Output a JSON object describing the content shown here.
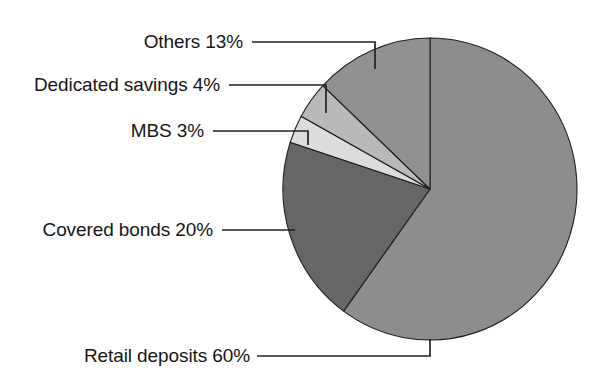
{
  "chart_data": {
    "type": "pie",
    "title": "",
    "subtitle": "",
    "xlabel": "",
    "ylabel": "",
    "legend_position": "none",
    "grid": false,
    "units": "percent",
    "start_angle_deg": 0,
    "direction": "clockwise",
    "categories": [
      "Retail deposits",
      "Covered bonds",
      "MBS",
      "Dedicated savings",
      "Others"
    ],
    "values": [
      60,
      20,
      3,
      4,
      13
    ],
    "slices": [
      {
        "name": "retail-deposits",
        "label": "Retail deposits 60%",
        "category": "Retail deposits",
        "value": 60,
        "value_text": "60%",
        "color": "#8d8d8d",
        "start_angle_deg": 0,
        "end_angle_deg": 216
      },
      {
        "name": "covered-bonds",
        "label": "Covered bonds 20%",
        "category": "Covered bonds",
        "value": 20,
        "value_text": "20%",
        "color": "#666666",
        "start_angle_deg": 216,
        "end_angle_deg": 288
      },
      {
        "name": "mbs",
        "label": "MBS 3%",
        "category": "MBS",
        "value": 3,
        "value_text": "3%",
        "color": "#dcdcdc",
        "start_angle_deg": 288,
        "end_angle_deg": 298.8
      },
      {
        "name": "dedicated-savings",
        "label": "Dedicated savings 4%",
        "category": "Dedicated savings",
        "value": 4,
        "value_text": "4%",
        "color": "#b9b9b9",
        "start_angle_deg": 298.8,
        "end_angle_deg": 313.2
      },
      {
        "name": "others",
        "label": "Others 13%",
        "category": "Others",
        "value": 13,
        "value_text": "13%",
        "color": "#919191",
        "start_angle_deg": 313.2,
        "end_angle_deg": 360
      }
    ],
    "geometry": {
      "center_x": 430,
      "center_y": 189,
      "radius_x": 147,
      "radius_y": 151
    },
    "outline_color": "#1f1f1f",
    "leader_line_color": "#222222",
    "background_color": "#ffffff"
  },
  "labels": {
    "others": "Others 13%",
    "dedicated_savings": "Dedicated savings 4%",
    "mbs": "MBS 3%",
    "covered_bonds": "Covered bonds 20%",
    "retail_deposits": "Retail deposits 60%"
  }
}
